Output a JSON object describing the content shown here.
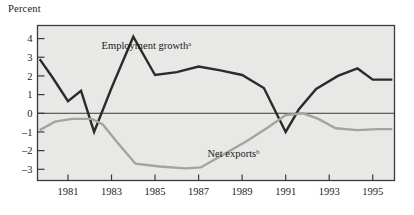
{
  "figure": {
    "axis_title": "Percent",
    "background_color": "#ffffff",
    "plot_background_color": "#e8e8e6",
    "frame_color": "#3a3a3a"
  },
  "chart_data": {
    "type": "line",
    "title": "",
    "subtitle": "",
    "xlabel": "",
    "ylabel": "Percent",
    "xlim": [
      1979.6,
      1996.0
    ],
    "ylim": [
      -3.6,
      4.7
    ],
    "grid": false,
    "legend_position": "inline-annotation",
    "x_tick_labels": [
      "1981",
      "1983",
      "1985",
      "1987",
      "1989",
      "1991",
      "1993",
      "1995"
    ],
    "x_tick_values": [
      1981,
      1983,
      1985,
      1987,
      1989,
      1991,
      1993,
      1995
    ],
    "y_tick_labels": [
      "4",
      "3",
      "2",
      "1",
      "0",
      "–1",
      "–2",
      "–3"
    ],
    "y_tick_values": [
      4,
      3,
      2,
      1,
      0,
      -1,
      -2,
      -3
    ],
    "zero_line": 0,
    "series": [
      {
        "name": "Employment growth",
        "footnote": "a",
        "color": "#2b2b2b",
        "width": 2.4,
        "label_x": 1984.6,
        "label_y": 3.45,
        "x": [
          1979.7,
          1980.3,
          1981.0,
          1981.6,
          1982.2,
          1983.0,
          1984.0,
          1985.0,
          1986.0,
          1987.0,
          1988.0,
          1989.0,
          1990.0,
          1991.0,
          1991.6,
          1992.4,
          1993.4,
          1994.3,
          1995.0,
          1995.9
        ],
        "values": [
          2.9,
          1.9,
          0.65,
          1.2,
          -1.0,
          1.35,
          4.1,
          2.05,
          2.2,
          2.5,
          2.3,
          2.05,
          1.35,
          -1.0,
          0.2,
          1.3,
          2.0,
          2.4,
          1.8,
          1.8
        ]
      },
      {
        "name": "Net exports",
        "footnote": "b",
        "color": "#a3a3a0",
        "width": 2.4,
        "label_x": 1988.6,
        "label_y": -2.35,
        "x": [
          1979.7,
          1980.4,
          1981.2,
          1982.1,
          1982.6,
          1983.3,
          1984.1,
          1985.2,
          1986.4,
          1987.1,
          1988.0,
          1989.2,
          1990.2,
          1991.0,
          1991.8,
          1992.5,
          1993.3,
          1994.3,
          1995.2,
          1995.9
        ],
        "values": [
          -0.9,
          -0.45,
          -0.3,
          -0.3,
          -0.6,
          -1.6,
          -2.7,
          -2.85,
          -2.95,
          -2.9,
          -2.3,
          -1.5,
          -0.75,
          -0.1,
          0.0,
          -0.3,
          -0.8,
          -0.9,
          -0.85,
          -0.85
        ]
      }
    ]
  }
}
